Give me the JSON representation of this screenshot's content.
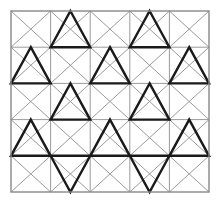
{
  "figure": {
    "width": 221,
    "height": 204,
    "background_color": "#ffffff"
  },
  "chart_data": {
    "type": "diagram",
    "grid": {
      "columns": 5,
      "rows": 5,
      "origin_x": 11,
      "origin_y": 11,
      "cell_width": 39.6,
      "cell_height": 36.2,
      "border_color": "#888888",
      "border_width": 1.4,
      "cell_line_color": "#9a9a9a",
      "cell_line_width": 1.0,
      "diagonals": "both",
      "show_grid": true
    },
    "bold_style": {
      "color": "#1a1a1a",
      "width": 2.4,
      "linecap": "square"
    },
    "bold_triangles": [
      {
        "row": 1,
        "col": 2,
        "apex": "up",
        "span": 1,
        "note": "apex at top edge, base on row 1 lower gridline"
      },
      {
        "row": 1,
        "col": 4,
        "apex": "up",
        "span": 1,
        "note": "apex at top edge, base on row 1 lower gridline"
      },
      {
        "row": 2,
        "col": 1,
        "apex": "up",
        "span": 1,
        "note": "apex at row 2 upper gridline midpoint"
      },
      {
        "row": 2,
        "col": 3,
        "apex": "up",
        "span": 1,
        "note": "apex at row 2 upper gridline midpoint"
      },
      {
        "row": 2,
        "col": 5,
        "apex": "up",
        "span": 1,
        "note": "apex at row 2 upper gridline midpoint"
      },
      {
        "row": 3,
        "col": 2,
        "apex": "up",
        "span": 1,
        "note": "apex at row 3 upper gridline midpoint"
      },
      {
        "row": 3,
        "col": 4,
        "apex": "up",
        "span": 1,
        "note": "apex at row 3 upper gridline midpoint"
      },
      {
        "row": 4,
        "col": 1,
        "apex": "up",
        "span": 1,
        "note": "apex at row 4 upper gridline midpoint"
      },
      {
        "row": 4,
        "col": 3,
        "apex": "up",
        "span": 1,
        "note": "apex at row 4 upper gridline midpoint"
      },
      {
        "row": 4,
        "col": 5,
        "apex": "up",
        "span": 1,
        "note": "apex at row 4 upper gridline midpoint"
      },
      {
        "row": 5,
        "col": 2,
        "apex": "down",
        "span": 1,
        "note": "base on row 5 upper gridline, apex at bottom edge"
      },
      {
        "row": 5,
        "col": 4,
        "apex": "down",
        "span": 1,
        "note": "base on row 5 upper gridline, apex at bottom edge"
      }
    ],
    "counts": {
      "total_cells": 25,
      "bold_triangles": 12,
      "upward_triangles": 10,
      "downward_triangles": 2
    },
    "xlabel": "",
    "ylabel": "",
    "legend": [],
    "annotations": []
  }
}
